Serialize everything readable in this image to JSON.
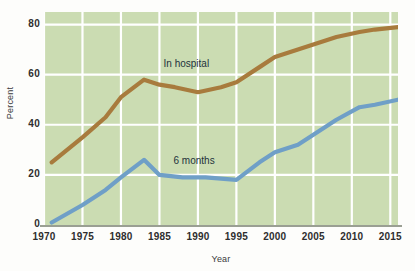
{
  "chart_data": {
    "type": "line",
    "title": "",
    "xlabel": "Year",
    "ylabel": "Percent",
    "xlim": [
      1970,
      2016
    ],
    "ylim": [
      0,
      85
    ],
    "xticks": [
      1970,
      1975,
      1980,
      1985,
      1990,
      1995,
      2000,
      2005,
      2010,
      2015
    ],
    "yticks": [
      0,
      20,
      40,
      60,
      80
    ],
    "grid": true,
    "legend_position": "inline-annotation",
    "plot_background": "#cbdcb2",
    "gridline_color": "#ffffff",
    "series": [
      {
        "name": "In hospital",
        "color": "#a87b3d",
        "label_x": 1988.5,
        "label_y": 64,
        "x": [
          1971,
          1975,
          1978,
          1980,
          1983,
          1985,
          1987,
          1990,
          1993,
          1995,
          1998,
          2000,
          2003,
          2005,
          2008,
          2011,
          2013,
          2016
        ],
        "values": [
          25,
          35,
          43,
          51,
          58,
          56,
          55,
          53,
          55,
          57,
          63,
          67,
          70,
          72,
          75,
          77,
          78,
          79
        ]
      },
      {
        "name": "6 months",
        "color": "#6f9fc7",
        "label_x": 1989.5,
        "label_y": 25,
        "x": [
          1971,
          1975,
          1978,
          1980,
          1983,
          1985,
          1988,
          1991,
          1995,
          1998,
          2000,
          2003,
          2005,
          2008,
          2011,
          2013,
          2016
        ],
        "values": [
          1,
          8,
          14,
          19,
          26,
          20,
          19,
          19,
          18,
          25,
          29,
          32,
          36,
          42,
          47,
          48,
          50
        ]
      }
    ]
  },
  "axes": {
    "ylabel": "Percent",
    "xlabel": "Year",
    "ytick_labels": [
      "80",
      "60",
      "40",
      "20",
      "0"
    ],
    "xtick_labels": [
      "1970",
      "1975",
      "1980",
      "1985",
      "1990",
      "1995",
      "2000",
      "2005",
      "2010",
      "2015"
    ]
  },
  "annotations": {
    "hospital_label": "In hospital",
    "six_months_label": "6 months"
  },
  "colors": {
    "hospital_line": "#a87b3d",
    "six_months_line": "#6f9fc7",
    "plot_bg": "#cbdcb2",
    "grid": "#ffffff",
    "axis": "#9a9f93",
    "page_bg": "#fdfdfb"
  }
}
